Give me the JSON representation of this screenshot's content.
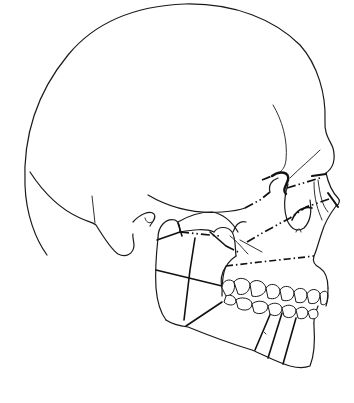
{
  "figure": {
    "colors": {
      "background": "#ffffff",
      "line": "#1a1a1a"
    },
    "elements": {
      "cranium": "cranium-outline",
      "orbit": "orbit-rim",
      "nasal": "nasal-bone",
      "zygomatic_arch": "zygomatic-arch",
      "condyle": "mandibular-condyle",
      "mastoid": "mastoid-process",
      "maxilla": "maxilla",
      "mandible": "mandible",
      "upper_teeth": "upper-dentition",
      "lower_teeth": "lower-dentition"
    },
    "fracture_lines": [
      "le-fort-iii-line",
      "le-fort-ii-line",
      "le-fort-i-line",
      "zygomatic-arch-fracture",
      "condylar-fracture",
      "ramus-fracture",
      "angle-fracture",
      "body-fracture",
      "parasymphyseal-fracture",
      "symphyseal-fracture"
    ]
  }
}
